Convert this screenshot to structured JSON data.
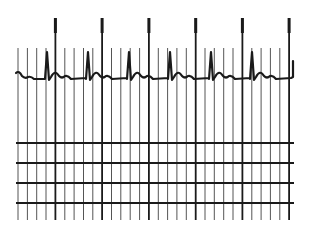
{
  "figure": {
    "colors": {
      "ink": "#1a1a1a",
      "grid": "#555555",
      "background": "#ffffff"
    }
  },
  "grid": {
    "x_start": 18,
    "spacing": 9.35,
    "count": 30,
    "major_every": 5,
    "major_positions": [
      55,
      102,
      149,
      196,
      244,
      291
    ],
    "horizontal_lines_y": [
      143,
      163,
      183,
      203
    ],
    "vertical_top_minor": 48,
    "vertical_top_major": 18,
    "vertical_bottom": 220,
    "h_line_x1": 16,
    "h_line_x2": 294
  },
  "trace": {
    "baseline_y": 79,
    "beats_x": [
      47,
      88,
      129,
      170,
      211,
      252
    ],
    "r_peak_y": 52,
    "start_x": 16,
    "end_x": 293,
    "end_marker_x": 293
  }
}
